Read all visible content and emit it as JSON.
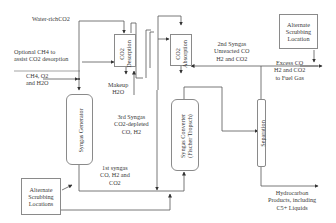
{
  "diagram": {
    "type": "process-flow",
    "units": {
      "syngas_generator": "Syngas Generator",
      "co2_desorption_line1": "CO2",
      "co2_desorption_line2": "Desorption",
      "co2_absorption_line1": "CO2",
      "co2_absorption_line2": "Absorption",
      "syngas_converter_line1": "Syngas Converter",
      "syngas_converter_line2": "(Fischer Tropsch)",
      "separation": "Separation",
      "alt_scrubbing_locations": [
        "Alternate",
        "Scrubbing",
        "Locations"
      ],
      "alt_scrubbing_location": [
        "Alternate",
        "Scrubbing",
        "Location"
      ]
    },
    "streams": {
      "water_rich_co2": "Water-richCO2",
      "optional_ch4": [
        "Optional CH4 to",
        "assist CO2 desorption"
      ],
      "feed": [
        "CH4, O2",
        "and H2O"
      ],
      "makeup_h2o": [
        "Makeup",
        "H2O"
      ],
      "third_syngas": [
        "3rd Syngas",
        "CO2-depleted",
        "CO, H2"
      ],
      "first_syngas": [
        "1st syngas",
        "CO, H2 and",
        "CO2"
      ],
      "second_syngas": [
        "2nd Syngas",
        "Unreacted CO",
        "H2 and CO2"
      ],
      "excess_co": [
        "Excess CO",
        "H2 and CO2",
        "to Fuel Gas"
      ],
      "hydrocarbon_products": [
        "Hydrocarbon",
        "Products, including",
        "C5+ Liquids"
      ]
    },
    "colors": {
      "line": "#4a4a4a",
      "box_border": "#8a8a8a",
      "text": "#3a3a3a",
      "background": "#ffffff"
    }
  }
}
